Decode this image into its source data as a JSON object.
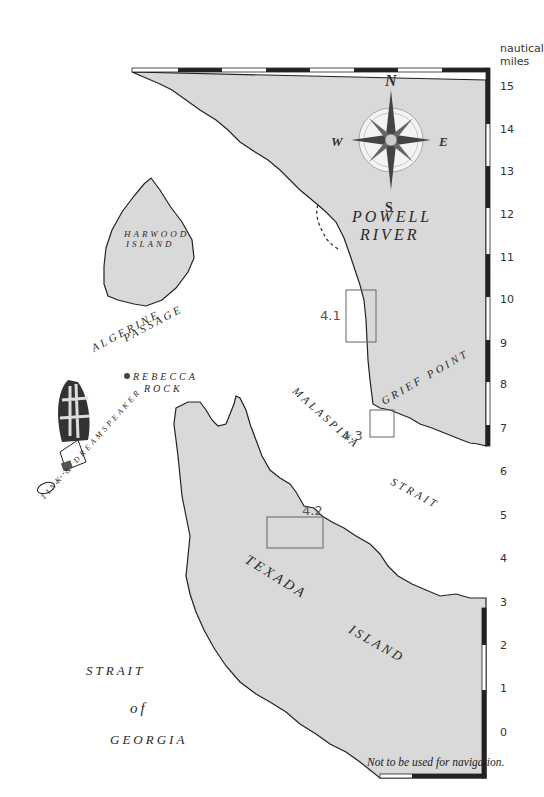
{
  "map": {
    "scale_unit": "nautical miles",
    "scale_unit_lines": [
      "nautical",
      "miles"
    ],
    "scale_ticks": [
      "15",
      "14",
      "13",
      "12",
      "11",
      "10",
      "9",
      "8",
      "7",
      "6",
      "5",
      "4",
      "3",
      "2",
      "1",
      "0"
    ],
    "disclaimer": "Not to be used for navigation.",
    "compass": {
      "n": "N",
      "s": "S",
      "e": "E",
      "w": "W",
      "ne": "NE",
      "nw": "NW",
      "se": "SE",
      "sw": "SW"
    },
    "labels": {
      "powell_river_1": "POWELL",
      "powell_river_2": "RIVER",
      "harwood_1": "HARWOOD",
      "harwood_2": "ISLAND",
      "algerine_1": "ALGERINE",
      "algerine_2": "PASSAGE",
      "rebecca_1": "REBECCA",
      "rebecca_2": "ROCK",
      "grief_point": "GRIEF POINT",
      "malaspina": "MALASPINA",
      "strait": "STRAIT",
      "texada": "TEXADA",
      "island": "ISLAND",
      "georgia_1": "STRAIT",
      "georgia_2": "of",
      "georgia_3": "GEORGIA",
      "boat_name": "TINK & DREAMSPEAKER"
    },
    "insets": [
      {
        "id": "4.1",
        "label": "4.1"
      },
      {
        "id": "4.2",
        "label": "4.2"
      },
      {
        "id": "4.3",
        "label": "4.3"
      }
    ],
    "colors": {
      "land": "#d9d9d9",
      "water": "#ffffff",
      "coast": "#222222",
      "inset_box": "#666666"
    }
  }
}
